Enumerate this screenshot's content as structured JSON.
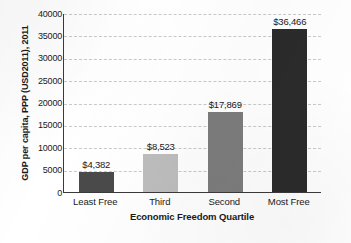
{
  "chart_data": {
    "type": "bar",
    "title": "",
    "xlabel": "Economic Freedom Quartile",
    "ylabel": "GDP per capita, PPP (USD2011), 2011",
    "categories": [
      "Least Free",
      "Third",
      "Second",
      "Most Free"
    ],
    "values": [
      4382,
      8523,
      17869,
      36466
    ],
    "data_labels": [
      "$4,382",
      "$8,523",
      "$17,869",
      "$36,466"
    ],
    "bar_colors": [
      "#4a4a4a",
      "#bdbdbd",
      "#7d7d7d",
      "#2b2b2b"
    ],
    "ylim": [
      0,
      40000
    ],
    "ytick_values": [
      0,
      5000,
      10000,
      15000,
      20000,
      25000,
      30000,
      35000,
      40000
    ],
    "ytick_labels": [
      "0",
      "5000",
      "10000",
      "15000",
      "20000",
      "25000",
      "30000",
      "35000",
      "40000"
    ],
    "grid": "horizontal-dashed",
    "legend": "none",
    "axis_color": "#3a3a3a",
    "gridline_color": "#c9c9c9"
  }
}
